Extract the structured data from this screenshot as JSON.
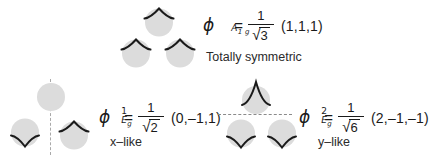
{
  "figure": {
    "background_color": "#ffffff",
    "orbital_fill_color": "#dcdcdc",
    "curve_color": "#1a1a1a",
    "nodal_line_color": "#a9a9a9"
  },
  "groups": [
    {
      "id": "a1g",
      "equation": {
        "symbol": "ϕ",
        "superscript": "",
        "subscript": "A",
        "subscript2": "1 g",
        "equals": "=",
        "numerator": "1",
        "sqrt_glyph": "√",
        "radicand": "3",
        "vector": "(1,1,1)"
      },
      "caption": "Totally symmetric",
      "orbitals": [
        {
          "name": "orbital-top",
          "phase": "up"
        },
        {
          "name": "orbital-bottom-left",
          "phase": "up"
        },
        {
          "name": "orbital-bottom-right",
          "phase": "up"
        }
      ]
    },
    {
      "id": "eg1",
      "equation": {
        "symbol": "ϕ",
        "superscript": "1",
        "subscript": "E",
        "subscript2": "g",
        "equals": "=",
        "numerator": "1",
        "sqrt_glyph": "√",
        "radicand": "2",
        "vector": "(0,–1,1)"
      },
      "caption": "x–like",
      "nodal_line": "vertical",
      "orbitals": [
        {
          "name": "orbital-top",
          "phase": "none"
        },
        {
          "name": "orbital-bottom-left",
          "phase": "down"
        },
        {
          "name": "orbital-bottom-right",
          "phase": "up"
        }
      ]
    },
    {
      "id": "eg2",
      "equation": {
        "symbol": "ϕ",
        "superscript": "2",
        "subscript": "E",
        "subscript2": "g",
        "equals": "=",
        "numerator": "1",
        "sqrt_glyph": "√",
        "radicand": "6",
        "vector": "(2,–1,–1)"
      },
      "caption": "y–like",
      "nodal_line": "horizontal",
      "orbitals": [
        {
          "name": "orbital-top",
          "phase": "tall-up"
        },
        {
          "name": "orbital-bottom-left",
          "phase": "down"
        },
        {
          "name": "orbital-bottom-right",
          "phase": "down"
        }
      ]
    }
  ]
}
